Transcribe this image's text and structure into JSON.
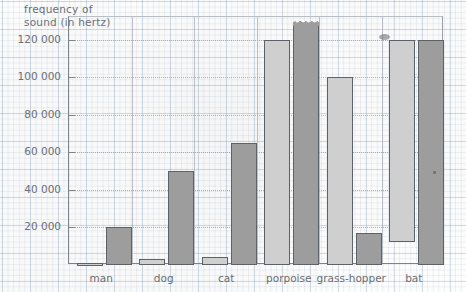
{
  "chart_data": {
    "type": "bar",
    "title": "frequency of\nsound (in hertz)",
    "xlabel": "",
    "ylabel": "frequency of sound (in hertz)",
    "ylim": [
      0,
      132000
    ],
    "grid": true,
    "legend_position": "none",
    "categories": [
      "man",
      "dog",
      "cat",
      "porpoise",
      "grass-hopper",
      "bat"
    ],
    "ytick_labels": [
      "20 000",
      "40 000",
      "60 000",
      "80 000",
      "100 000",
      "120 000"
    ],
    "ytick_values": [
      20000,
      40000,
      60000,
      80000,
      100000,
      120000
    ],
    "series": [
      {
        "name": "lowest frequency",
        "color": "#cfcfcf",
        "values": [
          1000,
          3000,
          4000,
          120000,
          100000,
          120000
        ],
        "baselines": [
          0,
          0,
          0,
          0,
          0,
          12000
        ]
      },
      {
        "name": "highest frequency",
        "color": "#9d9d9d",
        "values": [
          20000,
          50000,
          65000,
          128000,
          17000,
          120000
        ],
        "baselines": [
          0,
          0,
          0,
          0,
          0,
          0
        ],
        "clipped": [
          false,
          false,
          false,
          true,
          false,
          false
        ]
      }
    ],
    "annotations": [
      "porpoise upper bar extends beyond the top of the plot area (torn edge)",
      "bat lighter bar is drawn as a floating range from 12 000 upward"
    ]
  }
}
